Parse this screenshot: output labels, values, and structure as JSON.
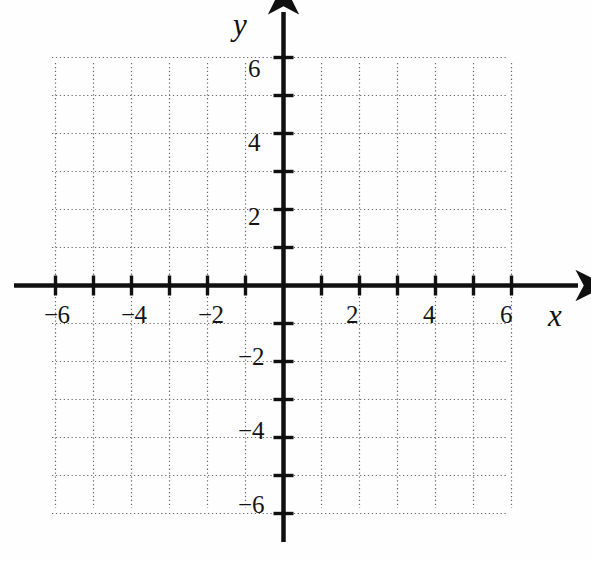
{
  "figure": {
    "kind": "cartesian-coordinate-grid",
    "background_color": "#fefefe",
    "ink_color": "#101010",
    "grid_color": "#6b6b6b"
  },
  "axes": {
    "x_axis_label": "x",
    "y_axis_label": "y",
    "x_label_position": {
      "x": 548,
      "y": 300
    },
    "y_label_position": {
      "x": 233,
      "y": 9
    }
  },
  "x_tick_labels": [
    {
      "text": "−6",
      "value": -6,
      "px": 53,
      "py": 302
    },
    {
      "text": "−4",
      "value": -4,
      "px": 130,
      "py": 302
    },
    {
      "text": "−2",
      "value": -2,
      "px": 207,
      "py": 302
    },
    {
      "text": "2",
      "value": 2,
      "px": 355,
      "py": 302
    },
    {
      "text": "4",
      "value": 4,
      "px": 432,
      "py": 302
    },
    {
      "text": "6",
      "value": 6,
      "px": 509,
      "py": 302
    }
  ],
  "y_tick_labels": [
    {
      "text": "6",
      "value": 6,
      "px": 248,
      "py": 56
    },
    {
      "text": "4",
      "value": 4,
      "px": 248,
      "py": 130
    },
    {
      "text": "2",
      "value": 2,
      "px": 248,
      "py": 204
    },
    {
      "text": "−2",
      "value": -2,
      "px": 238,
      "py": 344
    },
    {
      "text": "−4",
      "value": -4,
      "px": 238,
      "py": 418
    },
    {
      "text": "−6",
      "value": -6,
      "px": 238,
      "py": 492
    }
  ],
  "chart_data": {
    "type": "scatter",
    "title": "",
    "subtitle": "",
    "xlabel": "x",
    "ylabel": "y",
    "xlim": [
      -6,
      6
    ],
    "ylim": [
      -6,
      6
    ],
    "xticks": [
      -6,
      -5,
      -4,
      -3,
      -2,
      -1,
      0,
      1,
      2,
      3,
      4,
      5,
      6
    ],
    "yticks": [
      -6,
      -5,
      -4,
      -3,
      -2,
      -1,
      0,
      1,
      2,
      3,
      4,
      5,
      6
    ],
    "xtick_labels_shown": [
      -6,
      -4,
      -2,
      2,
      4,
      6
    ],
    "ytick_labels_shown": [
      -6,
      -4,
      -2,
      2,
      4,
      6
    ],
    "grid": true,
    "grid_style": "dotted",
    "grid_step": 1,
    "legend": null,
    "series": [],
    "annotations": [],
    "note": "Empty blank graph paper: no data plotted; only axes, ticks and unit grid."
  },
  "geometry": {
    "origin_px": {
      "x": 283.5,
      "y": 285.5
    },
    "unit_px": 38.0,
    "grid_bounds_px": {
      "left": 52,
      "top": 63,
      "right": 508,
      "bottom": 508
    },
    "x_axis_extent_px": {
      "start": 14,
      "end": 578
    },
    "y_axis_extent_px": {
      "start": 12,
      "end": 542
    },
    "tick_half_len_px": 10,
    "axis_stroke_px": 4.5,
    "tick_stroke_px": 3.4
  }
}
